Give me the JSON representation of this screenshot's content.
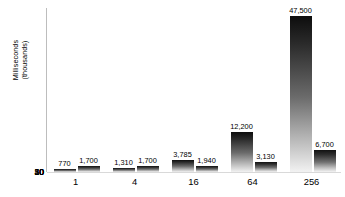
{
  "chart_data": {
    "type": "bar",
    "title": "",
    "subtitle": "",
    "xlabel": "",
    "ylabel": "Milliseconds\n(thousands)",
    "categories": [
      "1",
      "4",
      "16",
      "64",
      "256"
    ],
    "series": [
      {
        "name": "series-1",
        "values": [
          770,
          1310,
          3785,
          12200,
          47500
        ],
        "labels": [
          "770",
          "1,310",
          "3,785",
          "12,200",
          "47,500"
        ]
      },
      {
        "name": "series-2",
        "values": [
          1700,
          1700,
          1940,
          3130,
          6700
        ],
        "labels": [
          "1,700",
          "1,700",
          "1,940",
          "3,130",
          "6,700"
        ]
      }
    ],
    "ylim": [
      0,
      50000
    ],
    "y_ticks": [
      0,
      10,
      20,
      30,
      40,
      50
    ],
    "y_tick_labels": [
      "0",
      "10",
      "20",
      "30",
      "40",
      "50"
    ],
    "y_tick_units": "thousands",
    "grid": true,
    "legend": "none",
    "value_labels_shown": true,
    "colors": {
      "bar_top": "#0d0d0d",
      "bar_bottom": "#f2f2f2",
      "gridline": "#d9d9d9",
      "axis": "#9a9a9a",
      "text": "#000000",
      "background": "#ffffff"
    }
  }
}
